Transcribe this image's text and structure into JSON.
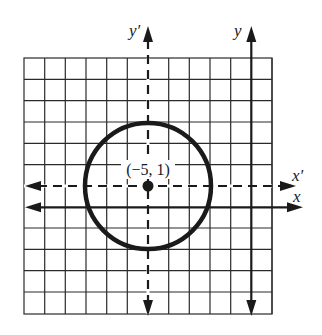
{
  "diagram": {
    "type": "translated-axes-circle",
    "grid": {
      "cols": 12,
      "rows": 12,
      "line_color": "#2a2a2a"
    },
    "axes": {
      "x_label": "x",
      "y_label": "y",
      "x_prime_label": "x′",
      "y_prime_label": "y′"
    },
    "circle": {
      "center_label": "(−5, 1)",
      "center": [
        -5,
        1
      ],
      "radius": 3,
      "stroke_color": "#1a1a1a"
    }
  }
}
